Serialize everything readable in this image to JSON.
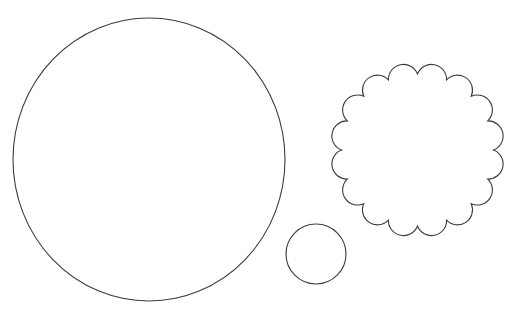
{
  "canvas": {
    "width": 510,
    "height": 312,
    "background": "#ffffff"
  },
  "stroke": {
    "color": "#3a3a3a",
    "width": 1.1
  },
  "shapes": {
    "large_circle": {
      "cx": 149,
      "cy": 159.5,
      "rx": 136,
      "ry": 141.5
    },
    "small_circle": {
      "cx": 316,
      "cy": 254,
      "r": 30
    },
    "scalloped_circle": {
      "cx": 417.5,
      "cy": 150,
      "outer_r": 87,
      "inner_r": 76,
      "scallops": 16,
      "rotation_deg": 0
    }
  }
}
